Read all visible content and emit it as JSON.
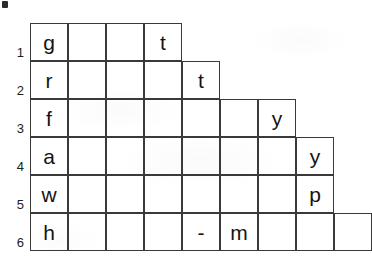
{
  "figure": {
    "name": "staircase-letter-grid",
    "background_color": "#ffffff",
    "line_color": "#3a3a3a",
    "text_color": "#141414",
    "origin": {
      "x": 30,
      "y": 23
    },
    "cell_width": 38,
    "cell_height": 38,
    "corner_mark": {
      "label": "corner-mark",
      "x": 2,
      "y": 1,
      "width": 6,
      "height": 7,
      "color": "#2b2b2b"
    }
  },
  "row_labels": [
    "1",
    "2",
    "3",
    "4",
    "5",
    "6"
  ],
  "rows": [
    {
      "label": "1",
      "cell_count": 4,
      "cells": [
        "g",
        "",
        "",
        "t"
      ]
    },
    {
      "label": "2",
      "cell_count": 5,
      "cells": [
        "r",
        "",
        "",
        "",
        "t"
      ]
    },
    {
      "label": "3",
      "cell_count": 7,
      "cells": [
        "f",
        "",
        "",
        "",
        "",
        "",
        "y"
      ]
    },
    {
      "label": "4",
      "cell_count": 8,
      "cells": [
        "a",
        "",
        "",
        "",
        "",
        "",
        "",
        "y"
      ]
    },
    {
      "label": "5",
      "cell_count": 8,
      "cells": [
        "w",
        "",
        "",
        "",
        "",
        "",
        "",
        "p"
      ]
    },
    {
      "label": "6",
      "cell_count": 9,
      "cells": [
        "h",
        "",
        "",
        "",
        "-",
        "m",
        "",
        "",
        ""
      ]
    }
  ],
  "first_column_word": "grfawh",
  "filled_letters": [
    "g",
    "t",
    "r",
    "t",
    "f",
    "y",
    "a",
    "y",
    "w",
    "p",
    "h",
    "-",
    "m"
  ]
}
